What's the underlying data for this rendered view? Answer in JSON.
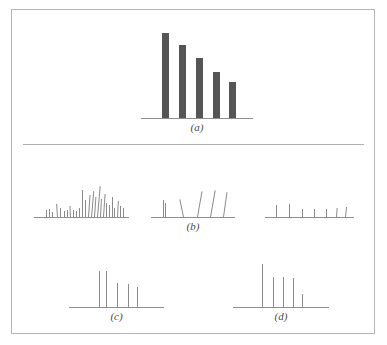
{
  "figure": {
    "title": "",
    "background_color": "#ffffff",
    "frame_color": "#b4b4b4",
    "bar_color": "#555555",
    "line_color": "#8a8a8a",
    "axis_color": "#8f8f8f",
    "divider_color": "#b0b0b0"
  },
  "captions": {
    "a": "(a)",
    "b": "(b)",
    "c": "(c)",
    "d": "(d)"
  },
  "chart_data": {
    "type": "bar",
    "title": "",
    "xlabel": "",
    "ylabel": "",
    "grid": false,
    "legend": "none",
    "panels": [
      {
        "id": "a",
        "caption": "(a)",
        "type": "bar",
        "axis": {
          "x0": 140,
          "x1": 252,
          "y": 117
        },
        "bar_width": 7,
        "categories": [
          "1",
          "2",
          "3",
          "4",
          "5"
        ],
        "values": [
          85,
          73,
          60,
          46,
          36
        ],
        "ylim": [
          0,
          100
        ],
        "bars": [
          {
            "x": 161,
            "height": 85,
            "tilt": 0
          },
          {
            "x": 178,
            "height": 73,
            "tilt": 0
          },
          {
            "x": 195,
            "height": 60,
            "tilt": 0
          },
          {
            "x": 212,
            "height": 46,
            "tilt": 0
          },
          {
            "x": 228,
            "height": 36,
            "tilt": 0
          }
        ]
      },
      {
        "id": "b-left",
        "caption": "",
        "type": "bar",
        "axis": {
          "x0": 33,
          "x1": 128,
          "y": 216
        },
        "bar_width": 1,
        "values": [
          7,
          8,
          5,
          13,
          9,
          6,
          7,
          11,
          7,
          6,
          9,
          27,
          17,
          22,
          26,
          20,
          31,
          18,
          23,
          14,
          12,
          20,
          9,
          16,
          11,
          9
        ],
        "ylim": [
          0,
          40
        ],
        "bars": [
          {
            "x": 45,
            "height": 7,
            "tilt": 0
          },
          {
            "x": 48,
            "height": 8,
            "tilt": 0
          },
          {
            "x": 51,
            "height": 5,
            "tilt": 0
          },
          {
            "x": 56,
            "height": 13,
            "tilt": -4
          },
          {
            "x": 59,
            "height": 9,
            "tilt": 0
          },
          {
            "x": 63,
            "height": 6,
            "tilt": 0
          },
          {
            "x": 66,
            "height": 7,
            "tilt": 0
          },
          {
            "x": 69,
            "height": 11,
            "tilt": -3
          },
          {
            "x": 72,
            "height": 7,
            "tilt": 0
          },
          {
            "x": 75,
            "height": 6,
            "tilt": 0
          },
          {
            "x": 78,
            "height": 9,
            "tilt": 0
          },
          {
            "x": 81,
            "height": 27,
            "tilt": 0
          },
          {
            "x": 84,
            "height": 17,
            "tilt": 0
          },
          {
            "x": 87,
            "height": 22,
            "tilt": 4
          },
          {
            "x": 90,
            "height": 26,
            "tilt": 5
          },
          {
            "x": 93,
            "height": 20,
            "tilt": 4
          },
          {
            "x": 96,
            "height": 31,
            "tilt": 5
          },
          {
            "x": 99,
            "height": 18,
            "tilt": 3
          },
          {
            "x": 102,
            "height": 23,
            "tilt": 4
          },
          {
            "x": 105,
            "height": 14,
            "tilt": 0
          },
          {
            "x": 108,
            "height": 12,
            "tilt": 0
          },
          {
            "x": 111,
            "height": 20,
            "tilt": 0
          },
          {
            "x": 113,
            "height": 9,
            "tilt": 0
          },
          {
            "x": 116,
            "height": 16,
            "tilt": 3
          },
          {
            "x": 119,
            "height": 11,
            "tilt": 0
          },
          {
            "x": 122,
            "height": 9,
            "tilt": 0
          }
        ]
      },
      {
        "id": "b-center",
        "caption": "(b)",
        "type": "bar",
        "axis": {
          "x0": 150,
          "x1": 234,
          "y": 216
        },
        "bar_width": 1,
        "values": [
          17,
          14,
          18,
          26,
          27,
          25
        ],
        "ylim": [
          0,
          40
        ],
        "bars": [
          {
            "x": 162,
            "height": 17,
            "tilt": 0
          },
          {
            "x": 164,
            "height": 14,
            "tilt": 0
          },
          {
            "x": 182,
            "height": 18,
            "tilt": -12
          },
          {
            "x": 196,
            "height": 26,
            "tilt": 10
          },
          {
            "x": 209,
            "height": 27,
            "tilt": 10
          },
          {
            "x": 222,
            "height": 25,
            "tilt": 8
          }
        ]
      },
      {
        "id": "b-right",
        "caption": "",
        "type": "bar",
        "axis": {
          "x0": 264,
          "x1": 353,
          "y": 216
        },
        "bar_width": 1,
        "values": [
          12,
          13,
          8,
          8,
          8,
          9,
          10
        ],
        "ylim": [
          0,
          40
        ],
        "bars": [
          {
            "x": 275,
            "height": 12,
            "tilt": 0
          },
          {
            "x": 288,
            "height": 13,
            "tilt": 0
          },
          {
            "x": 301,
            "height": 8,
            "tilt": 0
          },
          {
            "x": 313,
            "height": 8,
            "tilt": 0
          },
          {
            "x": 325,
            "height": 8,
            "tilt": 0
          },
          {
            "x": 335,
            "height": 9,
            "tilt": 4
          },
          {
            "x": 344,
            "height": 10,
            "tilt": 6
          }
        ]
      },
      {
        "id": "c",
        "caption": "(c)",
        "type": "bar",
        "axis": {
          "x0": 68,
          "x1": 163,
          "y": 306
        },
        "bar_width": 1,
        "values": [
          36,
          36,
          24,
          23,
          20
        ],
        "ylim": [
          0,
          50
        ],
        "bars": [
          {
            "x": 98,
            "height": 36,
            "tilt": 0
          },
          {
            "x": 105,
            "height": 36,
            "tilt": 0
          },
          {
            "x": 116,
            "height": 24,
            "tilt": 0
          },
          {
            "x": 127,
            "height": 23,
            "tilt": 0
          },
          {
            "x": 136,
            "height": 20,
            "tilt": 0
          }
        ]
      },
      {
        "id": "d",
        "caption": "(d)",
        "type": "bar",
        "axis": {
          "x0": 232,
          "x1": 328,
          "y": 306
        },
        "bar_width": 1,
        "values": [
          43,
          30,
          30,
          29,
          13
        ],
        "ylim": [
          0,
          50
        ],
        "bars": [
          {
            "x": 261,
            "height": 43,
            "tilt": 0
          },
          {
            "x": 272,
            "height": 30,
            "tilt": 0
          },
          {
            "x": 282,
            "height": 30,
            "tilt": 0
          },
          {
            "x": 292,
            "height": 29,
            "tilt": 0
          },
          {
            "x": 301,
            "height": 13,
            "tilt": 0
          }
        ]
      }
    ],
    "divider": {
      "x0": 22,
      "x1": 363,
      "y": 143
    }
  }
}
